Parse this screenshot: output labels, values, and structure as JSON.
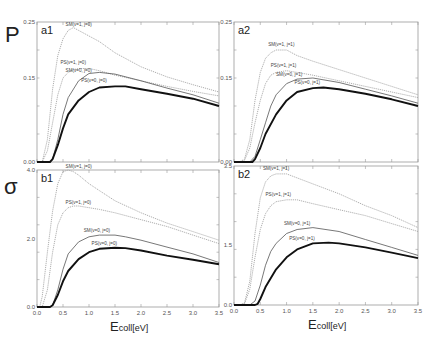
{
  "figure": {
    "y_symbols": {
      "top": "P",
      "bottom": "σ"
    },
    "xlabel_main": "E",
    "xlabel_sub": "coll[eV]"
  },
  "chart_data": [
    {
      "id": "a1",
      "type": "line",
      "panel_label": "a1",
      "ylabel": "P",
      "xlim": [
        0.0,
        3.5
      ],
      "ylim": [
        0.0,
        0.25
      ],
      "yticks": [
        "0.00",
        "0.15",
        "0.25"
      ],
      "xticks": [
        "0.0",
        "0.5",
        "1.0",
        "1.5",
        "2.0",
        "2.5",
        "3.0",
        "3.5"
      ],
      "series": [
        {
          "name": "SM(v=1, j=0)",
          "style": "dotted-light",
          "x": [
            0.0,
            0.1,
            0.2,
            0.3,
            0.4,
            0.5,
            0.6,
            0.7,
            0.8,
            1.0,
            1.2,
            1.5,
            2.0,
            2.5,
            3.0,
            3.5
          ],
          "y": [
            0.0,
            0.0,
            0.04,
            0.13,
            0.19,
            0.22,
            0.235,
            0.24,
            0.235,
            0.225,
            0.215,
            0.195,
            0.17,
            0.152,
            0.138,
            0.125
          ]
        },
        {
          "name": "PS(v=1, j=0)",
          "style": "dotted-light",
          "x": [
            0.0,
            0.1,
            0.2,
            0.3,
            0.4,
            0.5,
            0.6,
            0.7,
            0.8,
            1.0,
            1.2,
            1.5,
            2.0,
            2.5,
            3.0,
            3.5
          ],
          "y": [
            0.0,
            0.0,
            0.02,
            0.07,
            0.12,
            0.15,
            0.16,
            0.165,
            0.167,
            0.167,
            0.163,
            0.155,
            0.145,
            0.135,
            0.126,
            0.118
          ]
        },
        {
          "name": "SM(v=0, j=0)",
          "style": "thin-solid",
          "x": [
            0.0,
            0.25,
            0.3,
            0.4,
            0.5,
            0.6,
            0.8,
            1.0,
            1.2,
            1.5,
            2.0,
            2.5,
            3.0,
            3.5
          ],
          "y": [
            0.0,
            0.0,
            0.005,
            0.04,
            0.085,
            0.115,
            0.145,
            0.158,
            0.16,
            0.157,
            0.145,
            0.132,
            0.12,
            0.105
          ]
        },
        {
          "name": "PS(v=0, j=0)",
          "style": "thick-solid",
          "x": [
            0.0,
            0.25,
            0.3,
            0.4,
            0.5,
            0.6,
            0.8,
            1.0,
            1.2,
            1.5,
            1.7,
            2.0,
            2.5,
            3.0,
            3.5
          ],
          "y": [
            0.0,
            0.0,
            0.005,
            0.03,
            0.06,
            0.085,
            0.11,
            0.125,
            0.133,
            0.135,
            0.135,
            0.13,
            0.122,
            0.113,
            0.1
          ]
        }
      ]
    },
    {
      "id": "a2",
      "type": "line",
      "panel_label": "a2",
      "ylabel": "P",
      "xlim": [
        0.0,
        3.5
      ],
      "ylim": [
        0.0,
        0.25
      ],
      "yticks": [
        "0.00",
        "0.15",
        "0.25"
      ],
      "xticks": [
        "0.0",
        "0.5",
        "1.0",
        "1.5",
        "2.0",
        "2.5",
        "3.0",
        "3.5"
      ],
      "series": [
        {
          "name": "SM(v=1, j=1)",
          "style": "dotted-light",
          "x": [
            0.0,
            0.1,
            0.2,
            0.3,
            0.4,
            0.5,
            0.6,
            0.7,
            0.8,
            1.0,
            1.2,
            1.5,
            2.0,
            2.5,
            3.0,
            3.5
          ],
          "y": [
            0.0,
            0.0,
            0.005,
            0.04,
            0.11,
            0.16,
            0.185,
            0.195,
            0.2,
            0.2,
            0.19,
            0.18,
            0.165,
            0.15,
            0.135,
            0.12
          ]
        },
        {
          "name": "PS(v=1, j=1)",
          "style": "dotted-light",
          "x": [
            0.0,
            0.1,
            0.2,
            0.3,
            0.4,
            0.5,
            0.6,
            0.7,
            0.8,
            1.0,
            1.2,
            1.5,
            2.0,
            2.5,
            3.0,
            3.5
          ],
          "y": [
            0.0,
            0.0,
            0.003,
            0.025,
            0.07,
            0.11,
            0.14,
            0.155,
            0.16,
            0.163,
            0.16,
            0.155,
            0.145,
            0.135,
            0.125,
            0.115
          ]
        },
        {
          "name": "SM(v=0, j=1)",
          "style": "thin-solid",
          "x": [
            0.0,
            0.3,
            0.4,
            0.5,
            0.6,
            0.7,
            0.8,
            1.0,
            1.2,
            1.5,
            2.0,
            2.5,
            3.0,
            3.5
          ],
          "y": [
            0.0,
            0.0,
            0.01,
            0.04,
            0.07,
            0.1,
            0.12,
            0.14,
            0.148,
            0.15,
            0.142,
            0.13,
            0.118,
            0.105
          ]
        },
        {
          "name": "PS(v=0, j=1)",
          "style": "thick-solid",
          "x": [
            0.0,
            0.35,
            0.4,
            0.5,
            0.6,
            0.8,
            1.0,
            1.2,
            1.5,
            1.7,
            2.0,
            2.5,
            3.0,
            3.5
          ],
          "y": [
            0.0,
            0.0,
            0.005,
            0.025,
            0.05,
            0.085,
            0.11,
            0.125,
            0.132,
            0.133,
            0.13,
            0.122,
            0.112,
            0.1
          ]
        }
      ]
    },
    {
      "id": "b1",
      "type": "line",
      "panel_label": "b1",
      "ylabel": "σ",
      "xlim": [
        0.0,
        3.5
      ],
      "ylim": [
        0.0,
        4.0
      ],
      "yticks": [
        "0.0",
        "2.0",
        "4.0"
      ],
      "xticks": [
        "0.0",
        "0.5",
        "1.0",
        "1.5",
        "2.0",
        "2.5",
        "3.0",
        "3.5"
      ],
      "xlabel": "Ecoll[eV]",
      "series": [
        {
          "name": "SM(v=1, j=0)",
          "style": "dotted-light",
          "x": [
            0.0,
            0.05,
            0.1,
            0.2,
            0.3,
            0.4,
            0.5,
            0.6,
            0.7,
            0.8,
            1.0,
            1.2,
            1.5,
            2.0,
            2.5,
            3.0,
            3.5
          ],
          "y": [
            0.0,
            0.0,
            0.3,
            1.6,
            2.8,
            3.6,
            3.95,
            4.0,
            3.95,
            3.85,
            3.6,
            3.4,
            3.1,
            2.75,
            2.45,
            2.2,
            1.95
          ]
        },
        {
          "name": "PS(v=1, j=0)",
          "style": "dotted-light",
          "x": [
            0.0,
            0.1,
            0.2,
            0.3,
            0.4,
            0.5,
            0.6,
            0.7,
            0.8,
            1.0,
            1.2,
            1.5,
            2.0,
            2.5,
            3.0,
            3.5
          ],
          "y": [
            0.0,
            0.0,
            0.5,
            1.6,
            2.4,
            2.75,
            2.9,
            2.95,
            2.95,
            2.9,
            2.85,
            2.75,
            2.55,
            2.35,
            2.1,
            1.85
          ]
        },
        {
          "name": "SM(v=0, j=0)",
          "style": "thin-solid",
          "x": [
            0.0,
            0.25,
            0.3,
            0.4,
            0.5,
            0.6,
            0.8,
            1.0,
            1.2,
            1.5,
            1.7,
            2.0,
            2.5,
            3.0,
            3.5
          ],
          "y": [
            0.0,
            0.0,
            0.05,
            0.5,
            1.1,
            1.55,
            1.9,
            2.05,
            2.1,
            2.1,
            2.05,
            1.95,
            1.75,
            1.55,
            1.3
          ]
        },
        {
          "name": "PS(v=0, j=0)",
          "style": "thick-solid",
          "x": [
            0.0,
            0.25,
            0.3,
            0.4,
            0.5,
            0.6,
            0.8,
            1.0,
            1.2,
            1.5,
            1.7,
            2.0,
            2.5,
            3.0,
            3.5
          ],
          "y": [
            0.0,
            0.0,
            0.05,
            0.35,
            0.75,
            1.05,
            1.4,
            1.6,
            1.7,
            1.73,
            1.72,
            1.65,
            1.5,
            1.38,
            1.25
          ]
        }
      ]
    },
    {
      "id": "b2",
      "type": "line",
      "panel_label": "b2",
      "ylabel": "σ",
      "xlim": [
        0.0,
        3.5
      ],
      "ylim": [
        0.0,
        3.5
      ],
      "yticks": [
        "0.0",
        "1.5",
        "3.5"
      ],
      "xticks": [
        "0.0",
        "0.5",
        "1.0",
        "1.5",
        "2.0",
        "2.5",
        "3.0",
        "3.5"
      ],
      "xlabel": "Ecoll[eV]",
      "series": [
        {
          "name": "SM(v=1, j=1)",
          "style": "dotted-light",
          "x": [
            0.0,
            0.1,
            0.2,
            0.3,
            0.4,
            0.5,
            0.6,
            0.7,
            0.8,
            1.0,
            1.2,
            1.5,
            2.0,
            2.5,
            3.0,
            3.5
          ],
          "y": [
            0.0,
            0.0,
            0.05,
            0.6,
            1.8,
            2.7,
            3.1,
            3.25,
            3.3,
            3.3,
            3.2,
            3.05,
            2.8,
            2.5,
            2.25,
            1.95
          ]
        },
        {
          "name": "PS(v=1, j=1)",
          "style": "dotted-light",
          "x": [
            0.0,
            0.1,
            0.2,
            0.3,
            0.4,
            0.5,
            0.6,
            0.7,
            0.8,
            1.0,
            1.2,
            1.5,
            2.0,
            2.5,
            3.0,
            3.5
          ],
          "y": [
            0.0,
            0.0,
            0.03,
            0.4,
            1.2,
            1.9,
            2.3,
            2.5,
            2.6,
            2.65,
            2.65,
            2.55,
            2.4,
            2.25,
            2.05,
            1.85
          ]
        },
        {
          "name": "SM(v=0, j=1)",
          "style": "thin-solid",
          "x": [
            0.0,
            0.3,
            0.4,
            0.5,
            0.6,
            0.7,
            0.8,
            1.0,
            1.2,
            1.5,
            2.0,
            2.5,
            3.0,
            3.5
          ],
          "y": [
            0.0,
            0.0,
            0.1,
            0.5,
            1.0,
            1.35,
            1.55,
            1.8,
            1.9,
            1.95,
            1.85,
            1.65,
            1.45,
            1.25
          ]
        },
        {
          "name": "PS(v=0, j=1)",
          "style": "thick-solid",
          "x": [
            0.0,
            0.4,
            0.45,
            0.5,
            0.6,
            0.8,
            1.0,
            1.2,
            1.5,
            1.8,
            2.0,
            2.5,
            3.0,
            3.5
          ],
          "y": [
            0.0,
            0.0,
            0.03,
            0.15,
            0.45,
            0.9,
            1.2,
            1.4,
            1.55,
            1.57,
            1.55,
            1.45,
            1.32,
            1.18
          ]
        }
      ]
    }
  ]
}
